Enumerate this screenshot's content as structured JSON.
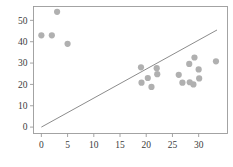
{
  "chart_data": {
    "type": "scatter",
    "title": "",
    "subtitle": "",
    "xlabel": "",
    "ylabel": "",
    "xlim": [
      -1.5,
      35.5
    ],
    "ylim": [
      -3.0,
      56.5
    ],
    "xticks": [
      0,
      5,
      10,
      15,
      20,
      25,
      30
    ],
    "yticks": [
      0,
      10,
      20,
      30,
      40,
      50
    ],
    "xticklabels": [
      "0",
      "5",
      "10",
      "15",
      "20",
      "25",
      "30"
    ],
    "yticklabels": [
      "0",
      "10",
      "20",
      "30",
      "40",
      "50"
    ],
    "grid": false,
    "legend": null,
    "legend_position": "none",
    "frame": true,
    "marker": {
      "shape": "circle",
      "color": "#b0b0b0",
      "size": 3.1
    },
    "series": [
      {
        "name": "points",
        "type": "scatter",
        "color": "#b0b0b0",
        "points": [
          {
            "x": 0.0,
            "y": 43.0
          },
          {
            "x": 2.0,
            "y": 43.0
          },
          {
            "x": 3.0,
            "y": 54.0
          },
          {
            "x": 5.0,
            "y": 39.0
          },
          {
            "x": 19.0,
            "y": 28.0
          },
          {
            "x": 19.1,
            "y": 20.8
          },
          {
            "x": 20.3,
            "y": 23.0
          },
          {
            "x": 21.0,
            "y": 18.8
          },
          {
            "x": 22.0,
            "y": 27.6
          },
          {
            "x": 22.1,
            "y": 24.8
          },
          {
            "x": 26.2,
            "y": 24.5
          },
          {
            "x": 26.9,
            "y": 20.8
          },
          {
            "x": 28.2,
            "y": 29.6
          },
          {
            "x": 28.3,
            "y": 21.0
          },
          {
            "x": 29.0,
            "y": 20.0
          },
          {
            "x": 29.2,
            "y": 32.6
          },
          {
            "x": 30.0,
            "y": 27.0
          },
          {
            "x": 30.1,
            "y": 22.8
          },
          {
            "x": 33.3,
            "y": 30.8
          }
        ]
      },
      {
        "name": "reference-line",
        "type": "line",
        "color": "#8c8c8c",
        "x0": 0.0,
        "y0": 0.0,
        "x1": 33.5,
        "y1": 45.5
      }
    ]
  }
}
